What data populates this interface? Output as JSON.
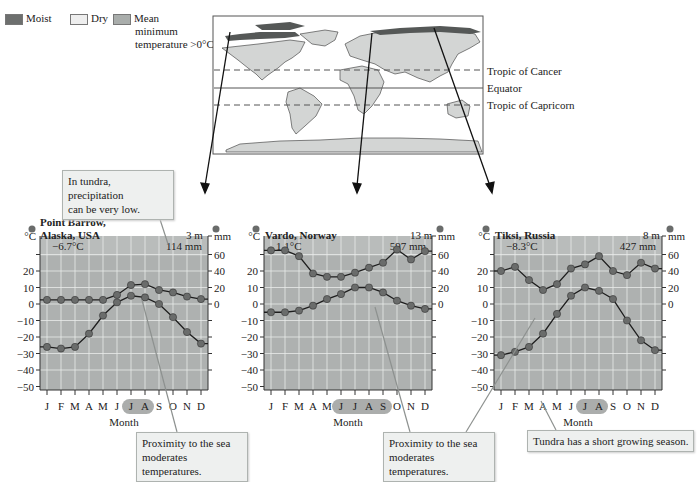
{
  "legend": {
    "items": [
      {
        "label": "Moist",
        "color": "#6d6f6e"
      },
      {
        "label": "Dry",
        "color": "#eeeeee"
      },
      {
        "label": "Mean minimum temperature >0°C",
        "color": "#a9adab"
      }
    ],
    "moist_label": "Moist",
    "dry_label": "Dry",
    "mean_label_1": "Mean",
    "mean_label_2": "minimum",
    "mean_label_3": "temperature >0°C"
  },
  "map": {
    "tropic_cancer": "Tropic of Cancer",
    "equator": "Equator",
    "tropic_capricorn": "Tropic of Capricorn"
  },
  "callouts": {
    "precip_low": "In tundra, precipitation can be very low.",
    "precip_low_1": "In tundra, precipitation",
    "precip_low_2": "can be very low.",
    "sea_1_line1": "Proximity to the sea",
    "sea_1_line2": "moderates temperatures.",
    "sea_2_line1": "Proximity to the sea",
    "sea_2_line2": "moderates temperatures.",
    "growing": "Tundra has a short growing season."
  },
  "colors": {
    "plot_bg": "#aeb1b0",
    "grid": "#e9ebea",
    "line": "#1d1d1d",
    "marker": "#6a6c6b",
    "callout_bg": "#eef0ef"
  },
  "chart_data": [
    {
      "type": "line",
      "title": "Point Barrow, Alaska, USA",
      "title_line1": "Point Barrow,",
      "title_line2": "Alaska, USA",
      "elevation": "3 m",
      "mean_temp": "−6.7°C",
      "annual_precip": "114 mm",
      "xlabel": "Month",
      "ylabel_left": "°C",
      "ylabel_right": "mm",
      "categories": [
        "J",
        "F",
        "M",
        "A",
        "M",
        "J",
        "J",
        "A",
        "S",
        "O",
        "N",
        "D"
      ],
      "highlight_months": [
        "J",
        "A"
      ],
      "left_ticks": [
        20,
        10,
        0,
        -10,
        -20,
        -30,
        -40,
        -50
      ],
      "right_ticks": [
        60,
        40,
        20,
        0
      ],
      "ylim_left": [
        -50,
        40
      ],
      "ylim_right": [
        0,
        60
      ],
      "grid": true,
      "series": [
        {
          "name": "Precipitation (mm)",
          "axis": "right",
          "values": [
            5,
            5,
            5,
            5,
            5,
            11,
            23,
            24,
            17,
            14,
            9,
            6
          ]
        },
        {
          "name": "Temperature (°C)",
          "axis": "left",
          "values": [
            -26,
            -27,
            -26,
            -18,
            -7,
            1,
            5,
            4,
            0,
            -8,
            -17,
            -24
          ]
        }
      ]
    },
    {
      "type": "line",
      "title": "Vardo, Norway",
      "elevation": "13 m",
      "mean_temp": "1.1°C",
      "annual_precip": "597 mm",
      "xlabel": "Month",
      "ylabel_left": "°C",
      "ylabel_right": "mm",
      "categories": [
        "J",
        "F",
        "M",
        "A",
        "M",
        "J",
        "J",
        "A",
        "S",
        "O",
        "N",
        "D"
      ],
      "highlight_months": [
        "J",
        "J",
        "A",
        "S"
      ],
      "left_ticks": [
        20,
        10,
        0,
        -10,
        -20,
        -30,
        -40,
        -50
      ],
      "right_ticks": [
        60,
        40,
        20,
        0
      ],
      "ylim_left": [
        -50,
        40
      ],
      "ylim_right": [
        0,
        60
      ],
      "grid": true,
      "series": [
        {
          "name": "Precipitation (mm)",
          "axis": "right",
          "values": [
            65,
            65,
            58,
            37,
            33,
            33,
            38,
            44,
            50,
            66,
            54,
            64
          ]
        },
        {
          "name": "Temperature (°C)",
          "axis": "left",
          "values": [
            -5,
            -5,
            -4,
            -1,
            3,
            6,
            10,
            10,
            7,
            2,
            -1,
            -3
          ]
        }
      ]
    },
    {
      "type": "line",
      "title": "Tiksi, Russia",
      "elevation": "8 m",
      "mean_temp": "−8.3°C",
      "annual_precip": "427 mm",
      "xlabel": "Month",
      "ylabel_left": "°C",
      "ylabel_right": "mm",
      "categories": [
        "J",
        "F",
        "M",
        "A",
        "M",
        "J",
        "J",
        "A",
        "S",
        "O",
        "N",
        "D"
      ],
      "highlight_months": [
        "J",
        "A"
      ],
      "left_ticks": [
        20,
        10,
        0,
        -10,
        -20,
        -30,
        -40,
        -50
      ],
      "right_ticks": [
        60,
        40,
        20,
        0
      ],
      "ylim_left": [
        -50,
        40
      ],
      "ylim_right": [
        0,
        60
      ],
      "grid": true,
      "series": [
        {
          "name": "Precipitation (mm)",
          "axis": "right",
          "values": [
            40,
            45,
            29,
            17,
            24,
            43,
            48,
            58,
            40,
            35,
            50,
            43
          ]
        },
        {
          "name": "Temperature (°C)",
          "axis": "left",
          "values": [
            -31,
            -29,
            -26,
            -18,
            -6,
            5,
            10,
            8,
            3,
            -10,
            -22,
            -28
          ]
        }
      ]
    }
  ]
}
